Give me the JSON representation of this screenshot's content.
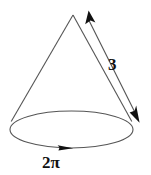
{
  "figure": {
    "name": "cone-with-dimensions",
    "background_color": "#ffffff",
    "stroke_color": "#555555",
    "arrow_color": "#111111",
    "text_color": "#111111",
    "labels": {
      "slant_height": "3",
      "base_circumference": "2π"
    },
    "geometry": {
      "apex": {
        "x": 73,
        "y": 15
      },
      "base_ellipse": {
        "cx": 71.5,
        "cy": 129.5,
        "rx": 61.5,
        "ry": 18.5
      },
      "left_edge": {
        "x1": 73,
        "y1": 15,
        "x2": 11,
        "y2": 121
      },
      "right_edge": {
        "x1": 73,
        "y1": 15,
        "x2": 132,
        "y2": 121
      },
      "slant_arrow": {
        "x1": 86,
        "y1": 14,
        "x2": 138,
        "y2": 119
      },
      "circumference_arrow_tip": {
        "x": 72,
        "y": 148
      }
    }
  }
}
